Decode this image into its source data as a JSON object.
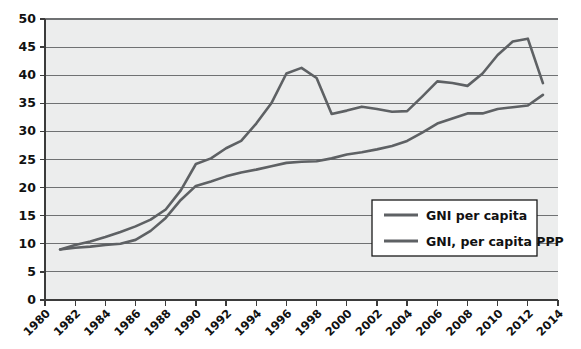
{
  "chart_data": {
    "type": "line",
    "title": "",
    "subtitle": "",
    "xlabel": "",
    "ylabel": "",
    "xlim": [
      1980,
      2014
    ],
    "ylim": [
      0,
      50
    ],
    "grid": true,
    "grid_axis": "y",
    "legend_position": "inside-right-lower",
    "x_tick_labels": [
      "1980",
      "1982",
      "1984",
      "1986",
      "1988",
      "1990",
      "1992",
      "1994",
      "1996",
      "1998",
      "2000",
      "2002",
      "2004",
      "2006",
      "2008",
      "2010",
      "2012",
      "2014"
    ],
    "x_tick_values": [
      1980,
      1982,
      1984,
      1986,
      1988,
      1990,
      1992,
      1994,
      1996,
      1998,
      2000,
      2002,
      2004,
      2006,
      2008,
      2010,
      2012,
      2014
    ],
    "y_tick_labels": [
      "0",
      "5",
      "10",
      "15",
      "20",
      "25",
      "30",
      "35",
      "40",
      "45",
      "50"
    ],
    "y_tick_values": [
      0,
      5,
      10,
      15,
      20,
      25,
      30,
      35,
      40,
      45,
      50
    ],
    "x": [
      1981,
      1982,
      1983,
      1984,
      1985,
      1986,
      1987,
      1988,
      1989,
      1990,
      1991,
      1992,
      1993,
      1994,
      1995,
      1996,
      1997,
      1998,
      1999,
      2000,
      2001,
      2002,
      2003,
      2004,
      2005,
      2006,
      2007,
      2008,
      2009,
      2010,
      2011,
      2012,
      2013
    ],
    "series": [
      {
        "name": "GNI per capita",
        "color": "#5e6164",
        "values": [
          9.0,
          9.3,
          9.5,
          9.8,
          10.0,
          10.7,
          12.3,
          14.6,
          17.8,
          20.3,
          21.1,
          22.0,
          22.7,
          23.2,
          23.8,
          24.4,
          24.6,
          24.7,
          25.2,
          25.9,
          26.3,
          26.8,
          27.4,
          28.3,
          29.8,
          31.4,
          32.3,
          33.2,
          33.2,
          34.0,
          34.3,
          34.6,
          36.5
        ]
      },
      {
        "name": "GNI, per capita PPP",
        "color": "#5e6164",
        "values": [
          9.0,
          9.8,
          10.4,
          11.2,
          12.1,
          13.1,
          14.3,
          16.1,
          19.5,
          24.2,
          25.2,
          27.0,
          28.3,
          31.4,
          35.0,
          40.3,
          41.3,
          39.5,
          33.1,
          33.7,
          34.4,
          34.0,
          33.5,
          33.6,
          36.2,
          38.9,
          38.6,
          38.1,
          40.3,
          43.6,
          46.0,
          46.5,
          38.6
        ]
      }
    ],
    "legend": [
      {
        "label": "GNI per capita",
        "color": "#5e6164"
      },
      {
        "label": "GNI, per capita PPP",
        "color": "#5e6164"
      }
    ],
    "colors": {
      "plot_background": "#eceded",
      "gridline": "#6f7173",
      "axis": "#3b3b3b",
      "text": "#111111",
      "page_background": "#ffffff"
    }
  }
}
